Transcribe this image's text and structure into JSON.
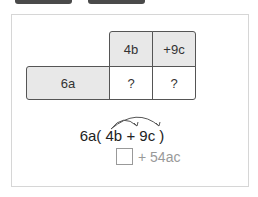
{
  "top_buttons": [
    {
      "label": ""
    },
    {
      "label": ""
    }
  ],
  "grid": {
    "header_row": [
      "4b",
      "+9c"
    ],
    "left_col": "6a",
    "cells": [
      "?",
      "?"
    ]
  },
  "expression": {
    "coef": "6a",
    "open": "(",
    "term1": "4b",
    "plus": "+",
    "term2": "9c",
    "close": ")"
  },
  "answer": {
    "box_value": "",
    "rest": "+ 54ac"
  },
  "colors": {
    "shaded": "#e8e8e8",
    "border": "#555555",
    "answer_text": "#999999"
  }
}
